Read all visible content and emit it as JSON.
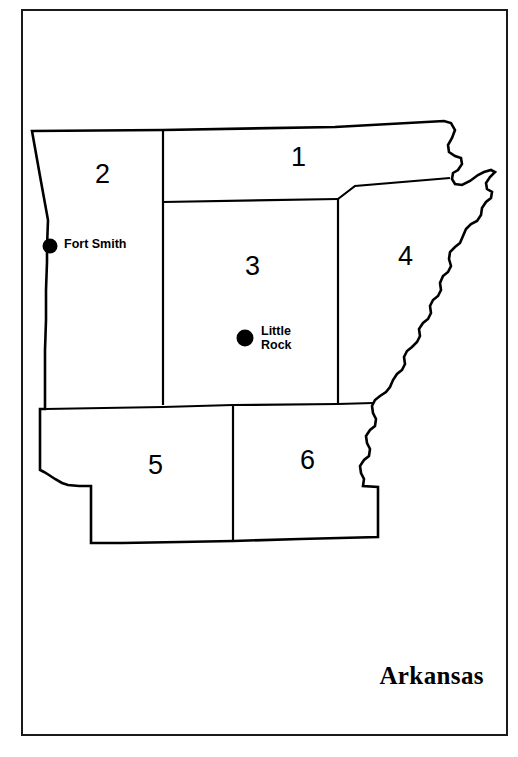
{
  "map": {
    "title": "Arkansas",
    "frame_color": "#1a1a1a",
    "outline_color": "#000000",
    "fill_color": "#ffffff",
    "districts": [
      {
        "id": "1",
        "label": "1",
        "x": 291,
        "y": 144
      },
      {
        "id": "2",
        "label": "2",
        "x": 95,
        "y": 161
      },
      {
        "id": "3",
        "label": "3",
        "x": 245,
        "y": 253
      },
      {
        "id": "4",
        "label": "4",
        "x": 398,
        "y": 243
      },
      {
        "id": "5",
        "label": "5",
        "x": 148,
        "y": 452
      },
      {
        "id": "6",
        "label": "6",
        "x": 300,
        "y": 447
      }
    ],
    "cities": [
      {
        "id": "fort-smith",
        "label": "Fort Smith",
        "dot_x": 50,
        "dot_y": 246,
        "dot_r": 7.5,
        "label_x": 64,
        "label_y": 238,
        "lines": [
          "Fort Smith"
        ]
      },
      {
        "id": "little-rock",
        "label": "Little Rock",
        "dot_x": 245,
        "dot_y": 338,
        "dot_r": 8.5,
        "label_x": 261,
        "label_y": 325,
        "lines": [
          "Little",
          "Rock"
        ]
      }
    ],
    "outline_path": "M 32,131 L 163,130 L 335,127 L 444,121 L 451,123 L 455,130 L 452,138 L 448,145 L 449,152 L 455,156 L 461,158 L 462,164 L 458,170 L 453,173 L 452,179 L 455,184 L 462,185 L 470,181 L 478,175 L 484,172 L 491,170 L 495,172 L 490,177 L 486,183 L 487,189 L 492,192 L 491,198 L 486,202 L 482,208 L 481,215 L 477,221 L 471,224 L 466,229 L 463,236 L 460,243 L 455,247 L 450,252 L 449,259 L 451,266 L 448,272 L 443,276 L 440,283 L 441,290 L 438,296 L 433,300 L 430,306 L 431,313 L 428,319 L 423,323 L 419,329 L 420,336 L 417,342 L 412,347 L 407,351 L 404,357 L 405,364 L 402,370 L 397,374 L 393,380 L 390,387 L 386,392 L 380,396 L 375,400 L 372,406 L 373,413 L 376,419 L 375,426 L 370,430 L 366,436 L 367,443 L 370,449 L 369,456 L 364,460 L 360,466 L 361,473 L 364,479 L 363,486 L 378,487 L 378,508 L 378,520 L 378,537 L 300,539 L 233,541 L 180,542 L 122,543 L 91,543 L 91,513 L 91,486 L 79,486 L 68,485 L 62,483 L 55,479 L 49,475 L 44,472 L 40,470 L 40,456 L 40,440 L 40,424 L 40,409 L 45,409 L 45,380 L 45,350 L 46,320 L 46,290 L 47,262 L 47,247 L 48,220 L 40,176 L 32,131 Z",
    "district_lines": [
      {
        "id": "line-2-3",
        "d": "M 163,131 L 163,405"
      },
      {
        "id": "line-1-3",
        "d": "M 163,202 L 338,199"
      },
      {
        "id": "line-3-4",
        "d": "M 338,199 L 338,404"
      },
      {
        "id": "line-1-4",
        "d": "M 338,199 L 355,186 L 450,178"
      },
      {
        "id": "line-345-56",
        "d": "M 45,409 L 163,407 L 233,405 L 338,404 L 373,403"
      },
      {
        "id": "line-5-6",
        "d": "M 233,405 L 233,541"
      }
    ]
  }
}
